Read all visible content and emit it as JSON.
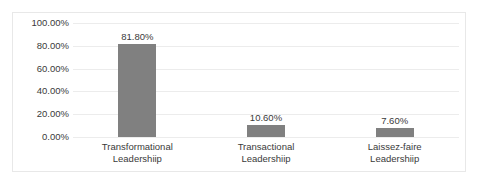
{
  "chart_data": {
    "type": "bar",
    "title": "",
    "xlabel": "",
    "ylabel": "",
    "categories": [
      "Transformational Leadershiip",
      "Transactional Leadershiip",
      "Laissez-faire Leadershiip"
    ],
    "category_lines": [
      [
        "Transformational",
        "Leadershiip"
      ],
      [
        "Transactional",
        "Leadershiip"
      ],
      [
        "Laissez-faire",
        "Leadershiip"
      ]
    ],
    "values": [
      81.8,
      10.6,
      7.6
    ],
    "data_labels": [
      "81.80%",
      "10.60%",
      "7.60%"
    ],
    "ylim": [
      0,
      100
    ],
    "ytick_values": [
      0,
      20,
      40,
      60,
      80,
      100
    ],
    "ytick_labels": [
      "100.00%",
      "80.00%",
      "60.00%",
      "40.00%",
      "20.00%",
      "0.00%"
    ],
    "grid": true,
    "legend": "none",
    "bar_color": "#808080",
    "gridline_color": "#ececec",
    "frame_color": "#e8e8e8",
    "text_color": "#3a3a3a",
    "background_color": "#ffffff"
  }
}
